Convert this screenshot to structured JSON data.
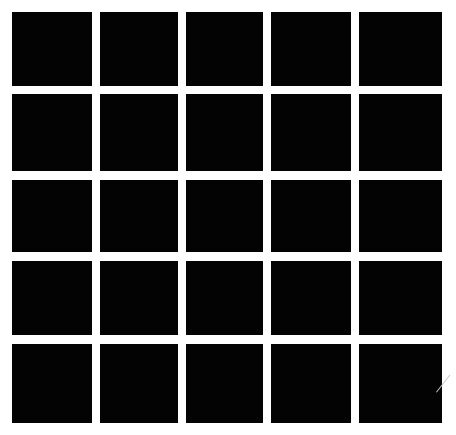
{
  "grid": {
    "rows": 5,
    "cols": 5,
    "cell_color": "#030303",
    "background_color": "#ffffff",
    "col_bounds": [
      [
        12,
        92
      ],
      [
        100,
        178
      ],
      [
        186,
        263
      ],
      [
        271,
        351
      ],
      [
        359,
        442
      ]
    ],
    "row_bounds": [
      [
        12,
        86
      ],
      [
        94,
        171
      ],
      [
        180,
        252
      ],
      [
        261,
        335
      ],
      [
        344,
        423
      ]
    ]
  }
}
